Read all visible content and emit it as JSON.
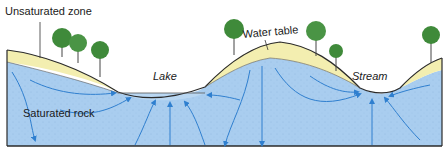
{
  "diagram": {
    "type": "groundwater cross-section",
    "labels": {
      "unsaturated_zone": "Unsaturated zone",
      "water_table": "Water table",
      "lake": "Lake",
      "stream": "Stream",
      "saturated_rock": "Saturated rock"
    },
    "colors": {
      "saturated": "#a9cdef",
      "unsaturated": "#f3eeb0",
      "lake_water": "#b9d7f2",
      "flow_lines": "#2f7fcf",
      "tree_foliage": "#3f8a3a",
      "outline": "#2a2a2a"
    }
  }
}
